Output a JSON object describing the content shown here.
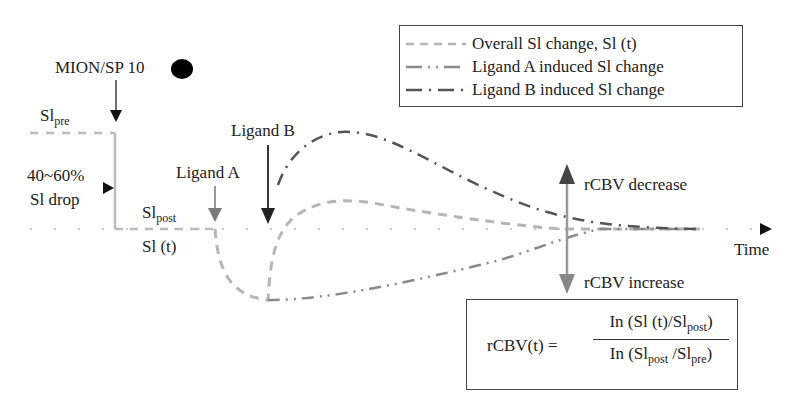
{
  "legend": {
    "items": [
      {
        "label": "Overall Sl change, Sl (t)",
        "style": "dashed",
        "color": "#b5b5b5"
      },
      {
        "label": "Ligand A induced Sl change",
        "style": "dash-dot-dot",
        "color": "#8a8a8a"
      },
      {
        "label": "Ligand B induced Sl change",
        "style": "dash-dot",
        "color": "#555555"
      }
    ]
  },
  "labels": {
    "mion": "MION/SP 10",
    "sl_pre_main": "Sl",
    "sl_pre_sub": "pre",
    "drop_line1": "40~60%",
    "drop_line2": "Sl drop",
    "sl_post_main": "Sl",
    "sl_post_sub": "post",
    "sl_t": "Sl (t)",
    "ligand_a": "Ligand A",
    "ligand_b": "Ligand B",
    "rcbv_decrease": "rCBV decrease",
    "rcbv_increase": "rCBV increase",
    "time": "Time"
  },
  "formula": {
    "lhs": "rCBV(t) =",
    "num_a": "In (Sl (t)/Sl",
    "num_sub": "post",
    "num_b": ")",
    "den_a": "In (Sl",
    "den_sub1": "post",
    "den_b": " /Sl",
    "den_sub2": "pre",
    "den_c": ")"
  },
  "colors": {
    "overall": "#b5b5b5",
    "ligand_a": "#8a8a8a",
    "ligand_b": "#555555",
    "arrow_dark": "#2a2a2a",
    "arrow_a": "#7a7a7a",
    "arrow_up": "#444444",
    "arrow_down": "#888888"
  }
}
